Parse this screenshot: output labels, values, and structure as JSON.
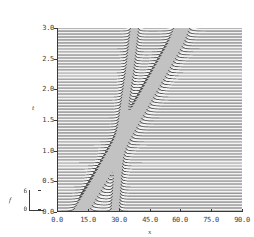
{
  "figure": {
    "name": "soliton-collision-waterfall",
    "background_color": "#ffffff",
    "frame_color": "#3a3a3a",
    "trace_color": "#555555"
  },
  "axes": {
    "x": {
      "label": "x",
      "ticks": [
        "0.0",
        "15.0",
        "30.0",
        "45.0",
        "60.0",
        "75.0",
        "90.0"
      ],
      "tick_values": [
        0,
        15,
        30,
        45,
        60,
        75,
        90
      ],
      "range": [
        0,
        90
      ]
    },
    "y": {
      "label": "t",
      "ticks": [
        "0.0",
        "0.5",
        "1.0",
        "1.5",
        "2.0",
        "2.5",
        "3.0"
      ],
      "tick_values": [
        0,
        0.5,
        1.0,
        1.5,
        2.0,
        2.5,
        3.0
      ],
      "range": [
        0,
        3.0
      ]
    }
  },
  "inset": {
    "label": "f",
    "top_tick": "6",
    "bottom_tick": "0",
    "range": [
      0,
      6
    ]
  },
  "chart_data": {
    "type": "line",
    "title": "",
    "xlabel": "x",
    "ylabel": "t",
    "xlim": [
      0,
      90
    ],
    "ylim": [
      0,
      3.0
    ],
    "grid": false,
    "legend": null,
    "plot_style": "waterfall / stacked time-slice traces",
    "n_traces": 62,
    "amplitude_scale": {
      "label": "f",
      "min": 0,
      "max": 6
    },
    "series": [
      {
        "name": "fast soliton",
        "comment": "tall narrow pulse, rightward-moving, large amplitude, steep track",
        "amplitude": 5.6,
        "width": 2.4,
        "track_x": [
          12.0,
          20.0,
          27.5,
          35.0,
          42.5,
          50.0,
          57.5,
          61.0
        ],
        "track_t": [
          0.0,
          0.45,
          0.9,
          1.35,
          1.8,
          2.25,
          2.7,
          3.0
        ]
      },
      {
        "name": "slow soliton",
        "comment": "narrower, lower pulse, slight rightward drift, near-vertical track",
        "amplitude": 3.1,
        "width": 1.5,
        "track_x": [
          28.0,
          29.0,
          30.0,
          31.2,
          33.0,
          35.0,
          36.5,
          37.5
        ],
        "track_t": [
          0.0,
          0.45,
          0.9,
          1.35,
          1.8,
          2.25,
          2.7,
          3.0
        ]
      }
    ],
    "interaction": {
      "type": "collision",
      "crossing_x": 33.0,
      "crossing_t": 1.5,
      "note": "phase shift visible after the two tracks cross"
    }
  }
}
